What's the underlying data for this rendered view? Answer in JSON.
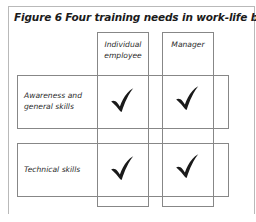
{
  "figure": {
    "title": "Figure 6  Four training needs in work-life balance",
    "caption_label": "Figure 6",
    "caption_text": "Four training needs in work-life balance"
  },
  "matrix": {
    "columns": [
      {
        "id": "individual",
        "label": "Individual employee"
      },
      {
        "id": "manager",
        "label": "Manager"
      }
    ],
    "rows": [
      {
        "id": "awareness",
        "label": "Awareness and general skills"
      },
      {
        "id": "technical",
        "label": "Technical skills"
      }
    ],
    "cells": [
      {
        "row": "awareness",
        "column": "individual",
        "mark": "check"
      },
      {
        "row": "awareness",
        "column": "manager",
        "mark": "check"
      },
      {
        "row": "technical",
        "column": "individual",
        "mark": "check"
      },
      {
        "row": "technical",
        "column": "manager",
        "mark": "check"
      }
    ],
    "mark_glyph": "check-mark"
  },
  "colors": {
    "frame_border": "#b9b9b9",
    "box_border": "#878787",
    "title_text": "#1b1b1b",
    "label_text": "#2b2b2b",
    "mark": "#1a1a1a",
    "background": "#ffffff"
  }
}
